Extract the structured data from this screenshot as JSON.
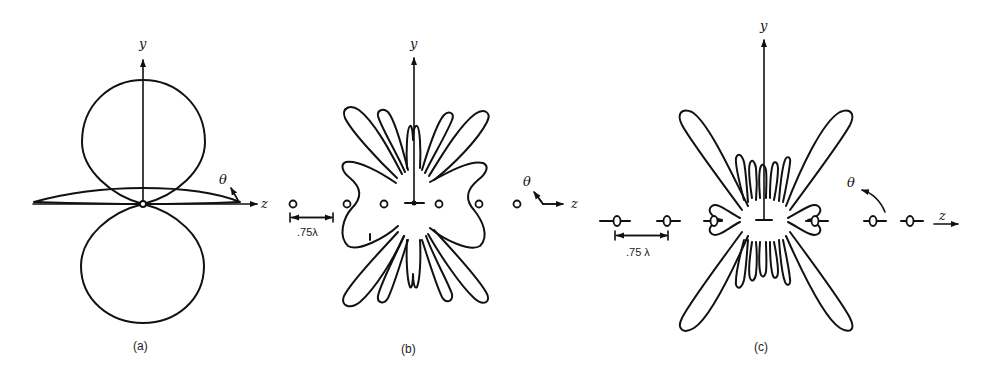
{
  "figure": {
    "panels": [
      {
        "id": "a",
        "caption": "(a)",
        "axis_y_label": "y",
        "axis_z_label": "z",
        "angle_label": "θ",
        "description": "Single element pattern: two circular lobes along y and a thin flattened lobe along z"
      },
      {
        "id": "b",
        "caption": "(b)",
        "axis_y_label": "y",
        "axis_z_label": "z",
        "angle_label": "θ",
        "spacing_label": ".75λ",
        "element_count": 7,
        "description": "Array factor of elements spaced .75λ along z, multi-lobe pattern"
      },
      {
        "id": "c",
        "caption": "(c)",
        "axis_y_label": "y",
        "axis_z_label": "z",
        "angle_label": "θ",
        "spacing_label": ".75 λ",
        "element_count": 7,
        "description": "Total pattern = element pattern × array factor, with four large diagonal lobes"
      }
    ]
  },
  "colors": {
    "stroke": "#111111",
    "background": "#ffffff"
  }
}
